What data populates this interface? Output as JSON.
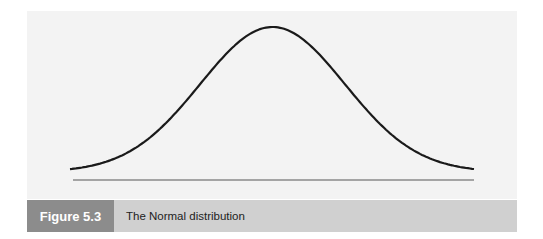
{
  "figure": {
    "label": "Figure 5.3",
    "title": "The Normal distribution"
  },
  "colors": {
    "panel_bg": "#f3f3f3",
    "curve": "#1a1a1a",
    "baseline": "#8a8a8a",
    "label_bg": "#8c8c8c",
    "title_bg": "#d0d0d0"
  },
  "chart_data": {
    "type": "line",
    "title": "The Normal distribution",
    "xlabel": "",
    "ylabel": "",
    "x": [
      -3,
      -2.5,
      -2,
      -1.5,
      -1,
      -0.5,
      0,
      0.5,
      1,
      1.5,
      2,
      2.5,
      3
    ],
    "values": [
      0.0044,
      0.0175,
      0.054,
      0.1295,
      0.242,
      0.3521,
      0.3989,
      0.3521,
      0.242,
      0.1295,
      0.054,
      0.0175,
      0.0044
    ],
    "grid": false,
    "legend": false
  }
}
